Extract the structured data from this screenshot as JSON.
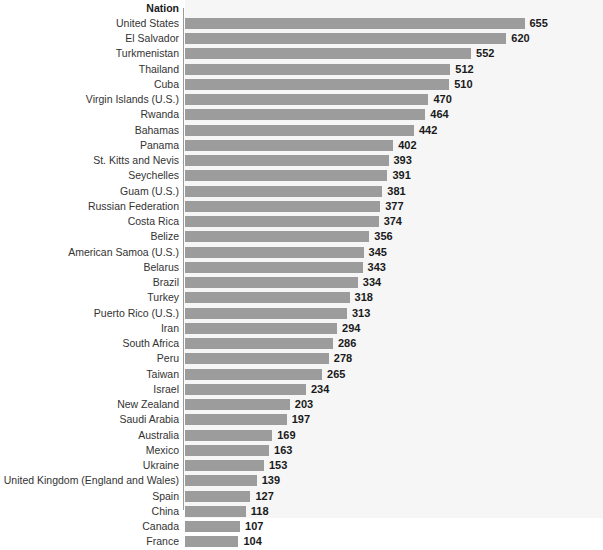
{
  "chart": {
    "type": "bar",
    "orientation": "horizontal",
    "column_header": "Nation",
    "colors": {
      "bar": "#9c9c9c",
      "plot_background": "#f6f6f6",
      "label_background": "#ffffff",
      "axis_line": "#9b9b9b",
      "label_text": "#333333",
      "value_text": "#1a1a1a"
    }
  },
  "chart_data": {
    "type": "bar",
    "title": "",
    "subtitle": "",
    "xlabel": "",
    "ylabel": "Nation",
    "orientation": "horizontal",
    "grid": false,
    "legend": "none",
    "xlim": [
      0,
      655
    ],
    "categories": [
      "United States",
      "El Salvador",
      "Turkmenistan",
      "Thailand",
      "Cuba",
      "Virgin Islands (U.S.)",
      "Rwanda",
      "Bahamas",
      "Panama",
      "St. Kitts and Nevis",
      "Seychelles",
      "Guam (U.S.)",
      "Russian Federation",
      "Costa Rica",
      "Belize",
      "American Samoa (U.S.)",
      "Belarus",
      "Brazil",
      "Turkey",
      "Puerto Rico (U.S.)",
      "Iran",
      "South Africa",
      "Peru",
      "Taiwan",
      "Israel",
      "New Zealand",
      "Saudi Arabia",
      "Australia",
      "Mexico",
      "Ukraine",
      "United Kingdom (England and Wales)",
      "Spain",
      "China",
      "Canada",
      "France"
    ],
    "values": [
      655,
      620,
      552,
      512,
      510,
      470,
      464,
      442,
      402,
      393,
      391,
      381,
      377,
      374,
      356,
      345,
      343,
      334,
      318,
      313,
      294,
      286,
      278,
      265,
      234,
      203,
      197,
      169,
      163,
      153,
      139,
      127,
      118,
      107,
      104
    ]
  }
}
